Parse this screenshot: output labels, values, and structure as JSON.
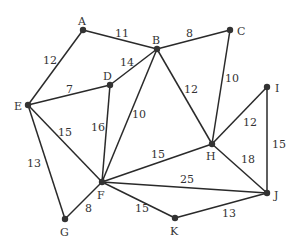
{
  "nodes": [
    {
      "id": "A",
      "x": 83,
      "y": 30,
      "lx": 78,
      "ly": 25
    },
    {
      "id": "B",
      "x": 157,
      "y": 49,
      "lx": 152,
      "ly": 44
    },
    {
      "id": "C",
      "x": 230,
      "y": 30,
      "lx": 237,
      "ly": 35
    },
    {
      "id": "D",
      "x": 110,
      "y": 85,
      "lx": 103,
      "ly": 80
    },
    {
      "id": "E",
      "x": 28,
      "y": 105,
      "lx": 14,
      "ly": 110
    },
    {
      "id": "F",
      "x": 102,
      "y": 182,
      "lx": 97,
      "ly": 199
    },
    {
      "id": "G",
      "x": 65,
      "y": 219,
      "lx": 60,
      "ly": 236
    },
    {
      "id": "H",
      "x": 212,
      "y": 144,
      "lx": 206,
      "ly": 160
    },
    {
      "id": "I",
      "x": 267,
      "y": 87,
      "lx": 275,
      "ly": 92
    },
    {
      "id": "J",
      "x": 267,
      "y": 193,
      "lx": 274,
      "ly": 199
    },
    {
      "id": "K",
      "x": 175,
      "y": 218,
      "lx": 170,
      "ly": 235
    }
  ],
  "edges": [
    {
      "from": "A",
      "to": "B",
      "weight": "11",
      "lx": 115,
      "ly": 37
    },
    {
      "from": "A",
      "to": "E",
      "weight": "12",
      "lx": 43,
      "ly": 64
    },
    {
      "from": "B",
      "to": "C",
      "weight": "8",
      "lx": 186,
      "ly": 37
    },
    {
      "from": "B",
      "to": "D",
      "weight": "14",
      "lx": 120,
      "ly": 66
    },
    {
      "from": "B",
      "to": "F",
      "weight": "10",
      "lx": 132,
      "ly": 118
    },
    {
      "from": "B",
      "to": "H",
      "weight": "12",
      "lx": 184,
      "ly": 93
    },
    {
      "from": "C",
      "to": "H",
      "weight": "10",
      "lx": 225,
      "ly": 82
    },
    {
      "from": "D",
      "to": "E",
      "weight": "7",
      "lx": 66,
      "ly": 93
    },
    {
      "from": "D",
      "to": "F",
      "weight": "16",
      "lx": 91,
      "ly": 131
    },
    {
      "from": "E",
      "to": "F",
      "weight": "15",
      "lx": 58,
      "ly": 136
    },
    {
      "from": "E",
      "to": "G",
      "weight": "13",
      "lx": 27,
      "ly": 167
    },
    {
      "from": "F",
      "to": "G",
      "weight": "8",
      "lx": 85,
      "ly": 212
    },
    {
      "from": "F",
      "to": "H",
      "weight": "15",
      "lx": 151,
      "ly": 158
    },
    {
      "from": "F",
      "to": "J",
      "weight": "25",
      "lx": 180,
      "ly": 183
    },
    {
      "from": "F",
      "to": "K",
      "weight": "15",
      "lx": 135,
      "ly": 212
    },
    {
      "from": "H",
      "to": "I",
      "weight": "12",
      "lx": 243,
      "ly": 126
    },
    {
      "from": "H",
      "to": "J",
      "weight": "18",
      "lx": 241,
      "ly": 163
    },
    {
      "from": "I",
      "to": "J",
      "weight": "15",
      "lx": 272,
      "ly": 148
    },
    {
      "from": "K",
      "to": "J",
      "weight": "13",
      "lx": 222,
      "ly": 217
    }
  ]
}
